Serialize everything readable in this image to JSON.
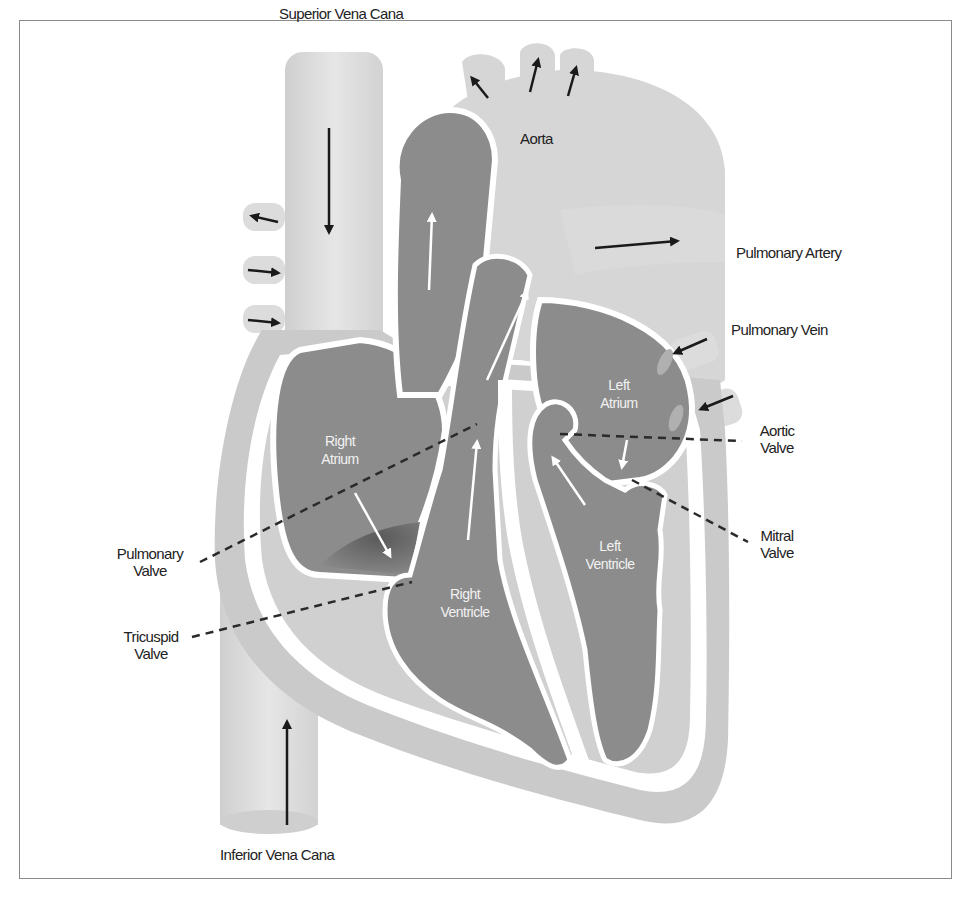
{
  "diagram": {
    "colors": {
      "vessel_light": "#d9d9d9",
      "chamber_dark": "#8c8c8c",
      "wall_mid": "#c4c4c4",
      "arrow_dark": "#1a1a1a",
      "arrow_light": "#ffffff",
      "border": "#8a8a8a"
    },
    "labels": {
      "superior_vena_cava": "Superior Vena Cana",
      "aorta": "Aorta",
      "pulmonary_artery": "Pulmonary Artery",
      "pulmonary_vein": "Pulmonary Vein",
      "aortic_valve": [
        "Aortic",
        "Valve"
      ],
      "mitral_valve": [
        "Mitral",
        "Valve"
      ],
      "pulmonary_valve": [
        "Pulmonary",
        "Valve"
      ],
      "tricuspid_valve": [
        "Tricuspid",
        "Valve"
      ],
      "inferior_vena_cava": "Inferior Vena Cana"
    },
    "chamber_labels": {
      "right_atrium": [
        "Right",
        "Atrium"
      ],
      "left_atrium": [
        "Left",
        "Atrium"
      ],
      "right_ventricle": [
        "Right",
        "Ventricle"
      ],
      "left_ventricle": [
        "Left",
        "Ventricle"
      ]
    }
  }
}
